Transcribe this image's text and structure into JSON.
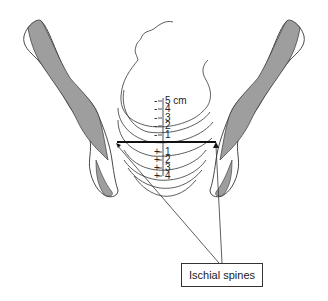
{
  "diagram": {
    "scale_above": [
      {
        "label": "5 cm",
        "sign": "-"
      },
      {
        "label": "4",
        "sign": "-"
      },
      {
        "label": "3",
        "sign": "-"
      },
      {
        "label": "2",
        "sign": "-"
      },
      {
        "label": "1",
        "sign": "-"
      }
    ],
    "scale_below": [
      {
        "label": "1",
        "sign": "+"
      },
      {
        "label": "2",
        "sign": "+"
      },
      {
        "label": "3",
        "sign": "+"
      },
      {
        "label": "4",
        "sign": "+"
      }
    ],
    "callout_label": "Ischial spines",
    "colors": {
      "bone_fill": "#9e9e9e",
      "outline": "#333333",
      "background": "#ffffff"
    }
  }
}
